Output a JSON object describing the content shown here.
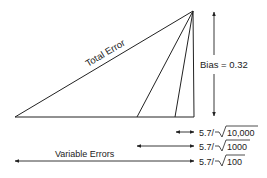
{
  "diagram": {
    "total_error_label": "Total Error",
    "bias_label": "Bias = 0.32",
    "variable_errors_label": "Variable Errors",
    "rows": [
      {
        "numerator": "5.7/",
        "radicand": "10,000"
      },
      {
        "numerator": "5.7/",
        "radicand": "1000"
      },
      {
        "numerator": "5.7/",
        "radicand": "100"
      }
    ],
    "colors": {
      "line": "#222222",
      "background": "#ffffff"
    }
  }
}
